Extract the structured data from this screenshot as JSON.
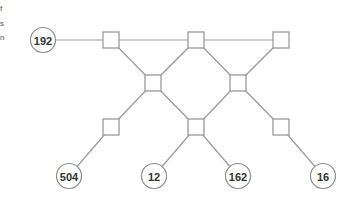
{
  "left_text_fragments": [
    "f",
    "s",
    "n"
  ],
  "colors": {
    "edge": "#9a9a9a",
    "node_stroke": "#8c8c8c",
    "label": "#333333",
    "background": "#ffffff"
  },
  "diagram": {
    "circles": [
      {
        "id": "c192",
        "label": "192",
        "cx": 43,
        "cy": 40
      },
      {
        "id": "c504",
        "label": "504",
        "cx": 69,
        "cy": 176
      },
      {
        "id": "c12",
        "label": "12",
        "cx": 154,
        "cy": 176
      },
      {
        "id": "c162",
        "label": "162",
        "cx": 238,
        "cy": 176
      },
      {
        "id": "c16",
        "label": "16",
        "cx": 323,
        "cy": 176
      }
    ],
    "squares": [
      {
        "id": "s1",
        "cx": 111,
        "cy": 40
      },
      {
        "id": "s2",
        "cx": 196,
        "cy": 40
      },
      {
        "id": "s3",
        "cx": 281,
        "cy": 40
      },
      {
        "id": "s4",
        "cx": 153,
        "cy": 83
      },
      {
        "id": "s5",
        "cx": 238,
        "cy": 83
      },
      {
        "id": "s6",
        "cx": 111,
        "cy": 127
      },
      {
        "id": "s7",
        "cx": 196,
        "cy": 127
      },
      {
        "id": "s8",
        "cx": 281,
        "cy": 127
      }
    ],
    "edges": [
      [
        "c192",
        "s1"
      ],
      [
        "s1",
        "s2"
      ],
      [
        "s2",
        "s3"
      ],
      [
        "s1",
        "s4"
      ],
      [
        "s2",
        "s4"
      ],
      [
        "s2",
        "s5"
      ],
      [
        "s3",
        "s5"
      ],
      [
        "s4",
        "s6"
      ],
      [
        "s4",
        "s7"
      ],
      [
        "s5",
        "s7"
      ],
      [
        "s5",
        "s8"
      ],
      [
        "s6",
        "c504"
      ],
      [
        "s7",
        "c12"
      ],
      [
        "s7",
        "c162"
      ],
      [
        "s8",
        "c16"
      ]
    ]
  }
}
